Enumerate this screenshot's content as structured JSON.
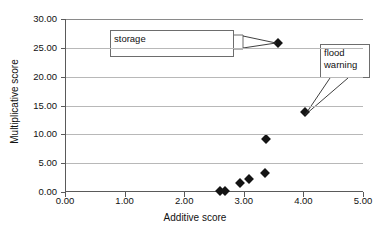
{
  "chart_data": {
    "type": "scatter",
    "title": "",
    "xlabel": "Additive score",
    "ylabel": "Multiplicative score",
    "xlim": [
      0.0,
      5.0
    ],
    "ylim": [
      0.0,
      30.0
    ],
    "xticks": [
      "0.00",
      "1.00",
      "2.00",
      "3.00",
      "4.00",
      "5.00"
    ],
    "xtick_values": [
      0.0,
      1.0,
      2.0,
      3.0,
      4.0,
      5.0
    ],
    "yticks": [
      "0.00",
      "5.00",
      "10.00",
      "15.00",
      "20.00",
      "25.00",
      "30.00"
    ],
    "ytick_values": [
      0.0,
      5.0,
      10.0,
      15.0,
      20.0,
      25.0,
      30.0
    ],
    "grid": "horizontal",
    "legend": "none",
    "marker": "diamond",
    "marker_color": "#141414",
    "points": [
      {
        "x": 2.6,
        "y": 0.1,
        "label": ""
      },
      {
        "x": 2.69,
        "y": 0.1,
        "label": ""
      },
      {
        "x": 2.93,
        "y": 1.6,
        "label": ""
      },
      {
        "x": 3.08,
        "y": 2.2,
        "label": ""
      },
      {
        "x": 3.35,
        "y": 3.3,
        "label": ""
      },
      {
        "x": 3.37,
        "y": 9.2,
        "label": ""
      },
      {
        "x": 4.03,
        "y": 13.8,
        "label": "flood warning"
      },
      {
        "x": 3.58,
        "y": 25.8,
        "label": "storage"
      }
    ],
    "annotations": [
      {
        "name": "storage",
        "text": "storage",
        "points_to": {
          "x": 3.58,
          "y": 25.8
        }
      },
      {
        "name": "flood-warning",
        "text": "flood\nwarning",
        "points_to": {
          "x": 4.03,
          "y": 13.8
        }
      }
    ]
  },
  "annotations": {
    "storage": {
      "text": "storage"
    },
    "flood_warning": {
      "line1": "flood",
      "line2": "warning"
    }
  }
}
